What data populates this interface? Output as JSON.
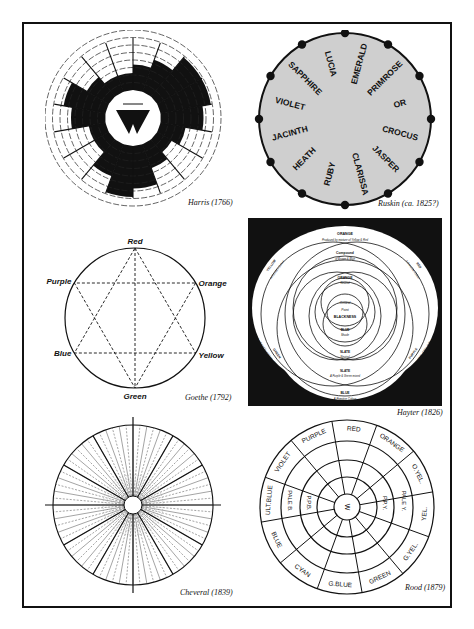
{
  "figure": {
    "panels": [
      {
        "id": "harris",
        "caption": "Harris (1766)",
        "type": "segmented-circle",
        "segments": 18,
        "rings": 6
      },
      {
        "id": "ruskin",
        "caption": "Ruskin (ca. 1825?)",
        "type": "named-circle",
        "labels": [
          "EMERALD",
          "PRIMROSE",
          "OR",
          "CROCUS",
          "JASPER",
          "CLARISSA",
          "RUBY",
          "HEATH",
          "JACINTH",
          "VIOLET",
          "SAPPHIRE",
          "LUCIA"
        ],
        "dots": 12,
        "fill_color": "#cfcfcf"
      },
      {
        "id": "goethe",
        "caption": "Goethe (1792)",
        "type": "hexagram-circle",
        "labels": {
          "top": "Red",
          "upper_right": "Orange",
          "lower_right": "Yellow",
          "bottom": "Green",
          "lower_left": "Blue",
          "upper_left": "Purple"
        }
      },
      {
        "id": "hayter",
        "caption": "Hayter (1826)",
        "type": "overlapping-circles",
        "labels": {
          "top_outer": "ORANGE",
          "top_outer_sub": "Produced by mixture of Yellow & Red",
          "top_mid": "Compound",
          "top_mid_sub": "of Brown & Blue",
          "inner_top": "ORANGE",
          "inner_top_sub": "Neutral",
          "center_1": "Central",
          "center_2": "Point",
          "center_3": "BLACKNESS",
          "inner_bottom": "BLUE",
          "inner_bottom_sub": "Shade",
          "slate": "SLATE",
          "slate_sub": "Neutral",
          "slate2": "SLATE",
          "slate2_sub": "A Purple & Green mixed",
          "bottom": "BLUE",
          "bottom_sub": "A Primitive Colour",
          "left_top": "YELLOW",
          "left_top_sub": "A Primitive Colour",
          "right_top": "RED",
          "right_top_sub": "A Primitive Colour",
          "left_bottom": "GREEN",
          "left_bottom_sub": "Produced by mixture of Yellow & Blue",
          "right_bottom": "PURPLE",
          "right_bottom_sub": "Produced by mixture of Blue & Red"
        }
      },
      {
        "id": "cheveral",
        "caption": "Cheveral (1839)",
        "type": "radial-lines-circle",
        "major_spokes": 12,
        "minor_spokes": 72
      },
      {
        "id": "rood",
        "caption": "Rood (1879)",
        "type": "segmented-rings",
        "center_label": "W",
        "outer_labels": [
          "RED",
          "ORANGE",
          "O.YEL.",
          "YEL.",
          "G.YEL.",
          "GREEN",
          "G.BLUE",
          "CYAN",
          "BLUE",
          "ULT.BLUE",
          "VIOLET",
          "PURPLE"
        ],
        "inner_labels": {
          "right_ring3": "PALE Y.",
          "right_ring2": "P.P.Y.",
          "left_ring3": "PALE B.",
          "left_ring2": "P.P.B."
        }
      }
    ]
  }
}
